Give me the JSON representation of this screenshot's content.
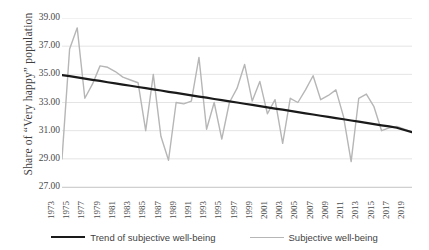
{
  "chart_data": {
    "type": "line",
    "title": "",
    "xlabel": "",
    "ylabel": "Share of “Very happy” population",
    "ylim": [
      27.0,
      39.0
    ],
    "yticks": [
      "39.00",
      "37.00",
      "35.00",
      "33.00",
      "31.00",
      "29.00",
      "27.00"
    ],
    "ytick_values": [
      39.0,
      37.0,
      35.0,
      33.0,
      31.0,
      29.0,
      27.0
    ],
    "grid": true,
    "grid_axis": "y",
    "legend_position": "bottom",
    "x": [
      1973,
      1974,
      1975,
      1976,
      1977,
      1978,
      1979,
      1980,
      1981,
      1982,
      1983,
      1984,
      1985,
      1986,
      1987,
      1988,
      1989,
      1990,
      1991,
      1992,
      1993,
      1994,
      1995,
      1996,
      1997,
      1998,
      1999,
      2000,
      2001,
      2002,
      2003,
      2004,
      2005,
      2006,
      2007,
      2008,
      2009,
      2010,
      2011,
      2012,
      2013,
      2014,
      2015,
      2016,
      2017,
      2018,
      2019
    ],
    "xtick_labels": [
      "1973",
      "1975",
      "1977",
      "1979",
      "1981",
      "1983",
      "1985",
      "1987",
      "1989",
      "1991",
      "1993",
      "1995",
      "1997",
      "1999",
      "2001",
      "2003",
      "2005",
      "2007",
      "2009",
      "2011",
      "2013",
      "2015",
      "2017",
      "2019"
    ],
    "series": [
      {
        "name": "Subjective well-being",
        "color": "#b6b6b6",
        "width": 1.4,
        "values": [
          29.0,
          36.8,
          38.3,
          33.3,
          34.3,
          35.6,
          35.5,
          35.2,
          34.8,
          34.6,
          34.4,
          31.0,
          35.0,
          30.6,
          28.9,
          33.0,
          32.9,
          33.1,
          36.2,
          31.1,
          33.0,
          30.4,
          33.0,
          34.0,
          35.7,
          33.1,
          34.5,
          32.2,
          33.2,
          30.1,
          33.3,
          33.0,
          33.9,
          34.9,
          33.2,
          33.5,
          33.9,
          32.0,
          28.8,
          33.3,
          33.6,
          32.7,
          31.0,
          31.2,
          31.3,
          31.1,
          30.9
        ]
      },
      {
        "name": "Trend of subjective well-being",
        "color": "#1a1a1a",
        "width": 2.2,
        "values": [
          34.95,
          34.87,
          34.78,
          34.7,
          34.61,
          34.53,
          34.44,
          34.36,
          34.27,
          34.19,
          34.1,
          34.02,
          33.93,
          33.85,
          33.76,
          33.68,
          33.59,
          33.51,
          33.42,
          33.34,
          33.25,
          33.17,
          33.08,
          33.0,
          32.91,
          32.83,
          32.74,
          32.66,
          32.57,
          32.49,
          32.4,
          32.32,
          32.23,
          32.15,
          32.06,
          31.98,
          31.89,
          31.81,
          31.72,
          31.64,
          31.55,
          31.47,
          31.38,
          31.3,
          31.21,
          31.05,
          30.9
        ]
      }
    ]
  },
  "legend": {
    "items": [
      {
        "label": "Trend of subjective well-being",
        "style": "trend"
      },
      {
        "label": "Subjective well-being",
        "style": "series"
      }
    ]
  }
}
